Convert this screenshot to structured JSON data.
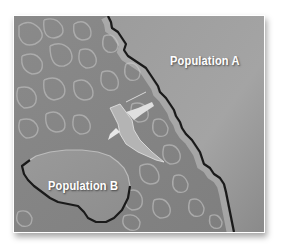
{
  "figure": {
    "type": "illustration",
    "style": "grayscale map with two separated regions",
    "labels": {
      "population_a": "Population A",
      "population_b": "Population B"
    },
    "elements": [
      {
        "name": "mainland-region",
        "description": "Large smooth region on right, bounded by jagged dark coastline",
        "label": "Population A"
      },
      {
        "name": "island-region",
        "description": "Smooth enclosed region lower-left with dark outline",
        "label": "Population B"
      },
      {
        "name": "water-pattern",
        "description": "Light wavy caustic pattern representing water between regions"
      },
      {
        "name": "bird",
        "description": "Light-colored bird flying over water between populations"
      }
    ],
    "colors": {
      "frame": "#ffffff",
      "water": "#8c8c8c",
      "land": "#9a9a9a",
      "coastline": "#1a1a1a",
      "label_text": "#ffffff"
    }
  }
}
